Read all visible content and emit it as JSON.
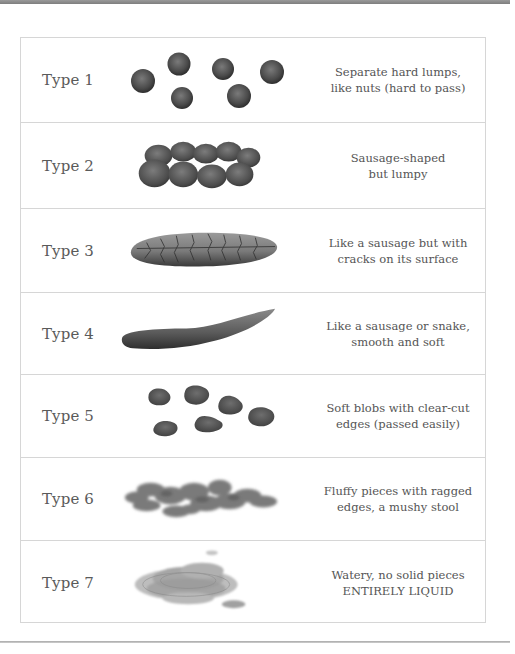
{
  "chart": {
    "rows": [
      {
        "label": "Type 1",
        "icon": "hard-lumps-illustration",
        "desc_line1": "Separate hard lumps,",
        "desc_line2": "like nuts (hard to pass)"
      },
      {
        "label": "Type 2",
        "icon": "lumpy-sausage-illustration",
        "desc_line1": "Sausage-shaped",
        "desc_line2": "but lumpy"
      },
      {
        "label": "Type 3",
        "icon": "cracked-sausage-illustration",
        "desc_line1": "Like a sausage but with",
        "desc_line2": "cracks on its surface"
      },
      {
        "label": "Type 4",
        "icon": "smooth-snake-illustration",
        "desc_line1": "Like a sausage or snake,",
        "desc_line2": "smooth and soft"
      },
      {
        "label": "Type 5",
        "icon": "soft-blobs-illustration",
        "desc_line1": "Soft blobs with clear-cut",
        "desc_line2": "edges (passed easily)"
      },
      {
        "label": "Type 6",
        "icon": "fluffy-pieces-illustration",
        "desc_line1": "Fluffy pieces with ragged",
        "desc_line2": "edges, a mushy stool"
      },
      {
        "label": "Type 7",
        "icon": "watery-liquid-illustration",
        "desc_line1": "Watery, no solid pieces",
        "desc_line2": "ENTIRELY LIQUID"
      }
    ]
  },
  "colors": {
    "text": "#555555",
    "border": "#d6d6d6",
    "top_bar": "#888888",
    "illustration_dark": "#3f3f3f",
    "illustration_mid": "#6b6b6b"
  }
}
